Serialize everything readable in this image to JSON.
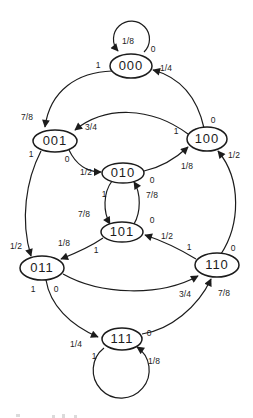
{
  "diagram": {
    "type": "state-transition-diagram",
    "colors": {
      "background": "#ffffff",
      "line": "#1c1c1c",
      "text": "#1c1c1c"
    },
    "states": [
      {
        "label": "000"
      },
      {
        "label": "001"
      },
      {
        "label": "100"
      },
      {
        "label": "010"
      },
      {
        "label": "101"
      },
      {
        "label": "011"
      },
      {
        "label": "110"
      },
      {
        "label": "111"
      }
    ],
    "transitions": [
      {
        "from": "000",
        "to": "000",
        "bit": "0",
        "prob": "1/8"
      },
      {
        "from": "000",
        "to": "001",
        "bit": "1",
        "prob": "7/8"
      },
      {
        "from": "100",
        "to": "000",
        "bit": "0",
        "prob": "1/4"
      },
      {
        "from": "100",
        "to": "001",
        "bit": "1",
        "prob": "3/4"
      },
      {
        "from": "001",
        "to": "010",
        "bit": "0",
        "prob": "1/2"
      },
      {
        "from": "001",
        "to": "011",
        "bit": "1",
        "prob": "1/2"
      },
      {
        "from": "010",
        "to": "100",
        "bit": "0",
        "prob": "1/8"
      },
      {
        "from": "010",
        "to": "101",
        "bit": "1",
        "prob": "7/8"
      },
      {
        "from": "101",
        "to": "010",
        "bit": "0",
        "prob": "7/8"
      },
      {
        "from": "101",
        "to": "011",
        "bit": "1",
        "prob": "1/8"
      },
      {
        "from": "110",
        "to": "100",
        "bit": "0",
        "prob": "1/2"
      },
      {
        "from": "110",
        "to": "101",
        "bit": "1",
        "prob": "1/2"
      },
      {
        "from": "011",
        "to": "110",
        "bit": "0",
        "prob": "3/4"
      },
      {
        "from": "011",
        "to": "111",
        "bit": "1",
        "prob": "1/4"
      },
      {
        "from": "111",
        "to": "110",
        "bit": "0",
        "prob": "7/8"
      },
      {
        "from": "111",
        "to": "111",
        "bit": "1",
        "prob": "1/8"
      }
    ]
  }
}
